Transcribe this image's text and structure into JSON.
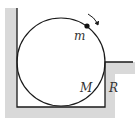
{
  "diagram": {
    "labels": {
      "small_mass": "m",
      "big_mass": "M",
      "radius": "R"
    },
    "colors": {
      "wall_shade": "#d9d9d9",
      "line": "#1a1a1a",
      "background": "#ffffff"
    }
  }
}
